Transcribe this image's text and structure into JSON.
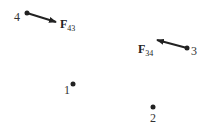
{
  "diagram": {
    "points": [
      {
        "id": "1",
        "label": "1",
        "x": 73,
        "y": 84
      },
      {
        "id": "2",
        "label": "2",
        "x": 153,
        "y": 107
      },
      {
        "id": "3",
        "label": "3",
        "x": 187,
        "y": 48
      },
      {
        "id": "4",
        "label": "4",
        "x": 27,
        "y": 13
      }
    ],
    "forces": [
      {
        "id": "F43",
        "symbol": "F",
        "subscript": "43",
        "from": "4",
        "x1": 27,
        "y1": 13,
        "x2": 56,
        "y2": 22
      },
      {
        "id": "F34",
        "symbol": "F",
        "subscript": "34",
        "from": "3",
        "x1": 187,
        "y1": 48,
        "x2": 157,
        "y2": 40
      }
    ],
    "colors": {
      "ink": "#222222",
      "background": "#ffffff"
    }
  }
}
